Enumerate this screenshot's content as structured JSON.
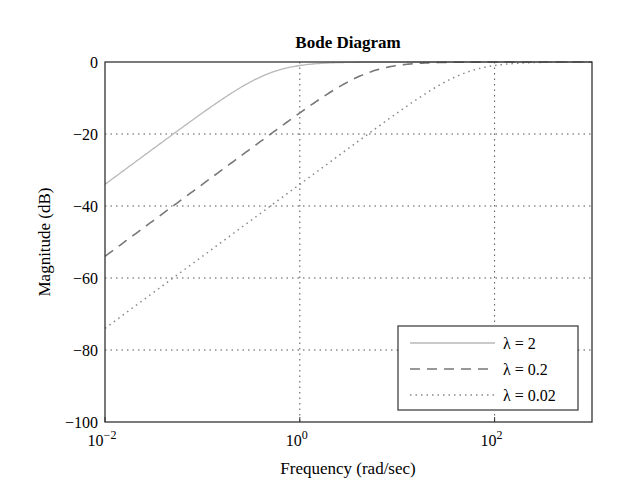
{
  "chart_data": {
    "type": "line",
    "title": "Bode Diagram",
    "xlabel": "Frequency (rad/sec)",
    "ylabel": "Magnitude (dB)",
    "xscale": "log",
    "xlim": [
      0.01,
      1000
    ],
    "ylim": [
      -100,
      0
    ],
    "x_ticks": [
      {
        "value": 0.01,
        "base": "10",
        "exp": "−2"
      },
      {
        "value": 1,
        "base": "10",
        "exp": "0"
      },
      {
        "value": 100,
        "base": "10",
        "exp": "2"
      }
    ],
    "y_ticks": [
      0,
      -20,
      -40,
      -60,
      -80,
      -100
    ],
    "y_tick_labels": [
      "0",
      "−20",
      "−40",
      "−60",
      "−80",
      "−100"
    ],
    "grid": true,
    "legend_position": "lower right",
    "series": [
      {
        "name": "λ = 2",
        "style": "solid",
        "color": "#b8b8b8",
        "corner": 0.5,
        "x": [
          0.01,
          0.1,
          0.5,
          1,
          10,
          1000
        ],
        "y": [
          -34,
          -14,
          -3,
          -1,
          0,
          0
        ]
      },
      {
        "name": "λ = 0.2",
        "style": "dashed",
        "color": "#777777",
        "corner": 5,
        "x": [
          0.01,
          0.1,
          1,
          5,
          10,
          100,
          1000
        ],
        "y": [
          -54,
          -34,
          -14,
          -3,
          -1,
          0,
          0
        ]
      },
      {
        "name": "λ = 0.02",
        "style": "dotted",
        "color": "#888888",
        "corner": 50,
        "x": [
          0.01,
          0.1,
          1,
          10,
          50,
          100,
          1000
        ],
        "y": [
          -74,
          -54,
          -34,
          -14,
          -3,
          -1,
          0
        ]
      }
    ]
  }
}
